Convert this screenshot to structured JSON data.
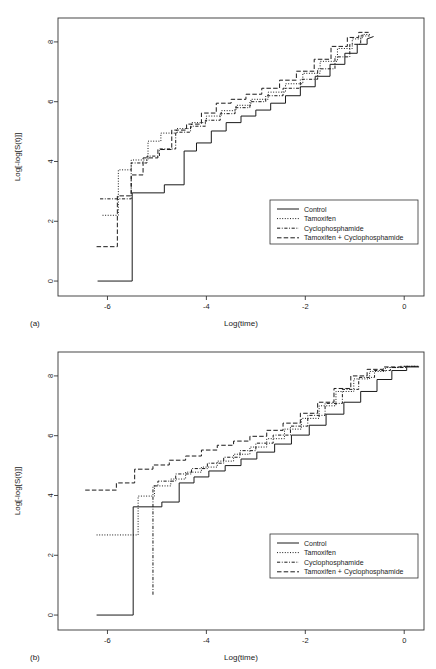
{
  "figure": {
    "panels": [
      {
        "id": "a",
        "label": "(a)",
        "xlabel": "Log(time)",
        "ylabel": "Log[-log[S(t)]]"
      },
      {
        "id": "b",
        "label": "(b)",
        "xlabel": "Log(time)",
        "ylabel": "Log[-log[S(t)]]"
      }
    ]
  },
  "legend": {
    "items": [
      {
        "label": "Control",
        "style": "solid"
      },
      {
        "label": "Tamoxifen",
        "style": "dotted"
      },
      {
        "label": "Cyclophosphamide",
        "style": "dashdot"
      },
      {
        "label": "Tamoxifen + Cyclophosphamide",
        "style": "dashed"
      }
    ]
  },
  "chart_data": [
    {
      "type": "line",
      "title": "(a)",
      "xlabel": "Log(time)",
      "ylabel": "Log[-log[S(t)]]",
      "xlim": [
        -7.0,
        0.4
      ],
      "ylim": [
        -0.5,
        8.8
      ],
      "xticks": [
        -6,
        -4,
        -2,
        0
      ],
      "yticks": [
        0,
        2,
        4,
        6,
        8
      ],
      "grid": false,
      "legend_position": "lower-right",
      "series": [
        {
          "name": "Control",
          "style": "solid",
          "x": [
            -6.2,
            -5.5,
            -5.5,
            -4.85,
            -4.85,
            -4.45,
            -4.45,
            -4.2,
            -4.2,
            -3.9,
            -3.9,
            -3.6,
            -3.6,
            -3.3,
            -3.3,
            -3.0,
            -3.0,
            -2.7,
            -2.7,
            -2.4,
            -2.4,
            -2.1,
            -2.1,
            -1.8,
            -1.8,
            -1.5,
            -1.5,
            -1.2,
            -1.2,
            -0.95,
            -0.95,
            -0.75,
            -0.75,
            -0.62
          ],
          "y": [
            0.0,
            0.0,
            2.95,
            2.95,
            3.22,
            3.22,
            4.35,
            4.35,
            4.62,
            4.62,
            5.02,
            5.02,
            5.3,
            5.3,
            5.52,
            5.52,
            5.72,
            5.72,
            5.95,
            5.95,
            6.2,
            6.2,
            6.5,
            6.5,
            6.85,
            6.85,
            7.25,
            7.25,
            7.62,
            7.62,
            7.92,
            7.92,
            8.1,
            8.18
          ]
        },
        {
          "name": "Tamoxifen",
          "style": "dotted",
          "x": [
            -6.1,
            -5.78,
            -5.78,
            -5.52,
            -5.52,
            -5.18,
            -5.18,
            -4.92,
            -4.92,
            -4.6,
            -4.6,
            -4.3,
            -4.3,
            -4.0,
            -4.0,
            -3.7,
            -3.7,
            -3.4,
            -3.4,
            -3.1,
            -3.1,
            -2.75,
            -2.75,
            -2.4,
            -2.4,
            -2.05,
            -2.05,
            -1.7,
            -1.7,
            -1.35,
            -1.35,
            -1.05,
            -1.05,
            -0.85,
            -0.85,
            -0.68
          ],
          "y": [
            2.2,
            2.2,
            3.72,
            3.72,
            4.05,
            4.05,
            4.68,
            4.68,
            4.95,
            4.95,
            5.1,
            5.1,
            5.3,
            5.3,
            5.52,
            5.52,
            5.7,
            5.7,
            5.88,
            5.88,
            6.08,
            6.08,
            6.32,
            6.32,
            6.6,
            6.6,
            6.95,
            6.95,
            7.35,
            7.35,
            7.78,
            7.78,
            8.1,
            8.1,
            8.25,
            8.25
          ]
        },
        {
          "name": "Cyclophosphamide",
          "style": "dashdot",
          "x": [
            -6.15,
            -5.52,
            -5.52,
            -5.2,
            -5.2,
            -4.95,
            -4.95,
            -4.62,
            -4.62,
            -4.32,
            -4.32,
            -4.02,
            -4.02,
            -3.72,
            -3.72,
            -3.42,
            -3.42,
            -3.12,
            -3.12,
            -2.8,
            -2.8,
            -2.45,
            -2.45,
            -2.1,
            -2.1,
            -1.75,
            -1.75,
            -1.4,
            -1.4,
            -1.1,
            -1.1,
            -0.88,
            -0.88,
            -0.7
          ],
          "y": [
            2.75,
            2.75,
            3.95,
            3.95,
            4.18,
            4.18,
            4.42,
            4.42,
            4.98,
            4.98,
            5.18,
            5.18,
            5.38,
            5.38,
            5.6,
            5.6,
            5.8,
            5.8,
            6.0,
            6.0,
            6.2,
            6.2,
            6.45,
            6.45,
            6.75,
            6.75,
            7.1,
            7.1,
            7.5,
            7.5,
            7.92,
            7.92,
            8.2,
            8.2
          ]
        },
        {
          "name": "Tamoxifen + Cyclophosphamide",
          "style": "dashed",
          "x": [
            -6.22,
            -5.8,
            -5.8,
            -5.52,
            -5.52,
            -5.28,
            -5.28,
            -4.98,
            -4.98,
            -4.7,
            -4.7,
            -4.4,
            -4.4,
            -4.1,
            -4.1,
            -3.8,
            -3.8,
            -3.5,
            -3.5,
            -3.2,
            -3.2,
            -2.88,
            -2.88,
            -2.52,
            -2.52,
            -2.18,
            -2.18,
            -1.82,
            -1.82,
            -1.48,
            -1.48,
            -1.15,
            -1.15,
            -0.92,
            -0.92,
            -0.72
          ],
          "y": [
            1.15,
            1.15,
            2.85,
            2.85,
            3.55,
            3.55,
            4.12,
            4.12,
            4.4,
            4.4,
            5.05,
            5.05,
            5.25,
            5.25,
            5.62,
            5.62,
            5.95,
            5.95,
            6.08,
            6.08,
            6.25,
            6.25,
            6.45,
            6.45,
            6.72,
            6.72,
            7.02,
            7.02,
            7.42,
            7.42,
            7.85,
            7.85,
            8.15,
            8.15,
            8.32,
            8.32
          ]
        }
      ]
    },
    {
      "type": "line",
      "title": "(b)",
      "xlabel": "Log(time)",
      "ylabel": "Log[-log[S(t)]]",
      "xlim": [
        -7.0,
        0.4
      ],
      "ylim": [
        -0.5,
        8.8
      ],
      "xticks": [
        -6,
        -4,
        -2,
        0
      ],
      "yticks": [
        0,
        2,
        4,
        6,
        8
      ],
      "grid": false,
      "legend_position": "lower-right",
      "series": [
        {
          "name": "Control",
          "style": "solid",
          "x": [
            -6.22,
            -5.48,
            -5.48,
            -4.9,
            -4.9,
            -4.55,
            -4.55,
            -4.25,
            -4.25,
            -3.95,
            -3.95,
            -3.62,
            -3.62,
            -3.3,
            -3.3,
            -2.98,
            -2.98,
            -2.62,
            -2.62,
            -2.28,
            -2.28,
            -1.92,
            -1.92,
            -1.58,
            -1.58,
            -1.22,
            -1.22,
            -0.88,
            -0.88,
            -0.55,
            -0.55,
            -0.25,
            -0.25,
            0.05,
            0.05,
            0.3
          ],
          "y": [
            0.0,
            0.0,
            3.62,
            3.62,
            3.78,
            3.78,
            4.42,
            4.42,
            4.62,
            4.62,
            4.82,
            4.82,
            5.0,
            5.0,
            5.22,
            5.22,
            5.45,
            5.45,
            5.72,
            5.72,
            6.02,
            6.02,
            6.35,
            6.35,
            6.72,
            6.72,
            7.12,
            7.12,
            7.48,
            7.48,
            7.88,
            7.88,
            8.18,
            8.18,
            8.3,
            8.3
          ]
        },
        {
          "name": "Tamoxifen",
          "style": "dotted",
          "x": [
            -6.22,
            -5.38,
            -5.38,
            -5.05,
            -5.05,
            -4.72,
            -4.72,
            -4.42,
            -4.42,
            -4.1,
            -4.1,
            -3.78,
            -3.78,
            -3.45,
            -3.45,
            -3.12,
            -3.12,
            -2.78,
            -2.78,
            -2.42,
            -2.42,
            -2.08,
            -2.08,
            -1.72,
            -1.72,
            -1.38,
            -1.38,
            -1.02,
            -1.02,
            -0.7,
            -0.7,
            -0.38,
            -0.38,
            -0.05,
            -0.05,
            0.28
          ],
          "y": [
            2.68,
            2.68,
            3.98,
            3.98,
            4.32,
            4.32,
            4.55,
            4.55,
            4.78,
            4.78,
            4.95,
            4.95,
            5.15,
            5.15,
            5.38,
            5.38,
            5.62,
            5.62,
            5.9,
            5.9,
            6.22,
            6.22,
            6.58,
            6.58,
            7.0,
            7.0,
            7.48,
            7.48,
            7.9,
            7.9,
            8.15,
            8.15,
            8.28,
            8.28,
            8.32,
            8.32
          ]
        },
        {
          "name": "Cyclophosphamide",
          "style": "dashdot",
          "x": [
            -5.08,
            -5.08,
            -4.98,
            -4.98,
            -4.62,
            -4.62,
            -4.3,
            -4.3,
            -3.98,
            -3.98,
            -3.65,
            -3.65,
            -3.32,
            -3.32,
            -3.0,
            -3.0,
            -2.65,
            -2.65,
            -2.3,
            -2.3,
            -1.95,
            -1.95,
            -1.6,
            -1.6,
            -1.25,
            -1.25,
            -0.92,
            -0.92,
            -0.6,
            -0.6,
            -0.28,
            -0.28,
            0.05,
            0.05,
            0.3
          ],
          "y": [
            0.68,
            4.32,
            4.32,
            4.48,
            4.48,
            4.72,
            4.72,
            4.9,
            4.9,
            5.08,
            5.08,
            5.28,
            5.28,
            5.5,
            5.5,
            5.75,
            5.75,
            6.02,
            6.02,
            6.32,
            6.32,
            6.68,
            6.68,
            7.08,
            7.08,
            7.55,
            7.55,
            7.95,
            7.95,
            8.18,
            8.18,
            8.28,
            8.28,
            8.32,
            8.32
          ]
        },
        {
          "name": "Tamoxifen + Cyclophosphamide",
          "style": "dashed",
          "x": [
            -6.45,
            -5.82,
            -5.82,
            -5.45,
            -5.45,
            -5.08,
            -5.08,
            -4.75,
            -4.75,
            -4.42,
            -4.42,
            -4.1,
            -4.1,
            -3.78,
            -3.78,
            -3.45,
            -3.45,
            -3.12,
            -3.12,
            -2.78,
            -2.78,
            -2.45,
            -2.45,
            -2.1,
            -2.1,
            -1.75,
            -1.75,
            -1.42,
            -1.42,
            -1.08,
            -1.08,
            -0.75,
            -0.75,
            -0.42,
            -0.42,
            -0.08,
            -0.08,
            0.28
          ],
          "y": [
            4.18,
            4.18,
            4.42,
            4.42,
            4.88,
            4.88,
            5.02,
            5.02,
            5.18,
            5.18,
            5.32,
            5.32,
            5.52,
            5.52,
            5.68,
            5.68,
            5.82,
            5.82,
            5.98,
            5.98,
            6.18,
            6.18,
            6.42,
            6.42,
            6.75,
            6.75,
            7.12,
            7.12,
            7.58,
            7.58,
            8.0,
            8.0,
            8.22,
            8.22,
            8.3,
            8.3,
            8.32,
            8.32
          ]
        }
      ]
    }
  ]
}
